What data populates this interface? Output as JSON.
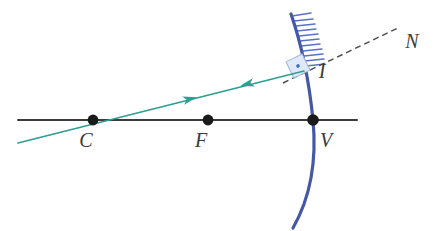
{
  "figure": {
    "kind": "optics-ray-diagram",
    "background_color": "#ffffff"
  },
  "colors": {
    "mirror": "#4558a6",
    "mirror_hatch": "#5a72c4",
    "ray": "#2f9e90",
    "axis": "#3b3b3b",
    "normal_dashed": "#4a4a4a",
    "point_dot": "#1a1a1a",
    "right_angle_fill": "#dfe9f7",
    "right_angle_stroke": "#9fb8de",
    "right_angle_dot": "#3a6fc4",
    "label_text": "#3a3a3a"
  },
  "labels": {
    "center_of_curvature": "C",
    "focal_point": "F",
    "vertex": "V",
    "incidence_point": "I",
    "normal": "N"
  },
  "points": {
    "C": {
      "x": 93,
      "y": 120
    },
    "F": {
      "x": 208,
      "y": 120
    },
    "V": {
      "x": 313,
      "y": 120
    },
    "I": {
      "x": 304,
      "y": 71
    }
  },
  "label_positions": {
    "C": {
      "x": 86,
      "y": 145
    },
    "F": {
      "x": 201,
      "y": 145
    },
    "V": {
      "x": 322,
      "y": 145
    },
    "I": {
      "x": 318,
      "y": 74
    },
    "N": {
      "x": 408,
      "y": 44
    }
  },
  "axis": {
    "name": "principal-axis",
    "x1": 18,
    "y1": 120,
    "x2": 357,
    "y2": 120,
    "width": 2.0
  },
  "mirror": {
    "name": "concave-mirror-arc",
    "path": "M 291 14 C 300 40, 309 80, 313 120 C 317 162, 310 198, 293 228",
    "width": 3.2,
    "hatch_count": 11,
    "hatch_length": 19
  },
  "ray": {
    "name": "light-ray",
    "incident": {
      "x1": 18,
      "y1": 143,
      "x2": 304,
      "y2": 71
    },
    "reflected": {
      "x1": 304,
      "y1": 71,
      "x2": 18,
      "y2": 143
    },
    "width": 1.6,
    "arrow_incoming": {
      "x": 190,
      "y": 99,
      "direction": "right"
    },
    "arrow_reflected": {
      "x": 247,
      "y": 84,
      "direction": "left"
    }
  },
  "normal_line": {
    "name": "normal-dashed-line",
    "x1": 283,
    "y1": 83,
    "x2": 400,
    "y2": 27,
    "dash": "6 4",
    "width": 1.4
  },
  "right_angle_marker": {
    "x": 289,
    "y": 57,
    "size": 18,
    "rotation": -26,
    "dot_radius": 1.8
  }
}
